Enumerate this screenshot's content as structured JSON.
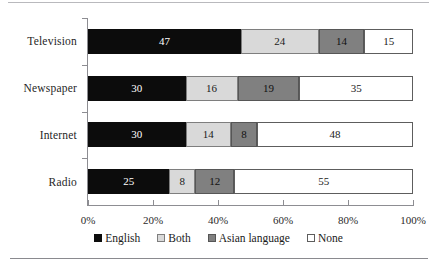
{
  "chart_data": {
    "type": "bar",
    "orientation": "horizontal",
    "stacked": true,
    "stack_mode": "percent",
    "title": "",
    "subtitle": "",
    "xlabel": "",
    "ylabel": "",
    "xlim": [
      0,
      100
    ],
    "xticks": [
      0,
      20,
      40,
      60,
      80,
      100
    ],
    "xtick_labels": [
      "0%",
      "20%",
      "40%",
      "60%",
      "80%",
      "100%"
    ],
    "grid": false,
    "legend_position": "bottom",
    "categories": [
      "Television",
      "Newspaper",
      "Internet",
      "Radio"
    ],
    "series": [
      {
        "name": "English",
        "color": "#0c0c0c",
        "values": [
          47,
          30,
          30,
          25
        ]
      },
      {
        "name": "Both",
        "color": "#d9d9d9",
        "values": [
          24,
          16,
          14,
          8
        ]
      },
      {
        "name": "Asian language",
        "color": "#808080",
        "values": [
          14,
          19,
          8,
          12
        ]
      },
      {
        "name": "None",
        "color": "#ffffff",
        "values": [
          15,
          35,
          48,
          55
        ]
      }
    ],
    "bars": [
      {
        "category": "Television",
        "segments": [
          {
            "series": "English",
            "value": 47,
            "label": "47",
            "start": 0,
            "color": "#0c0c0c"
          },
          {
            "series": "Both",
            "value": 24,
            "label": "24",
            "start": 47,
            "color": "#d9d9d9"
          },
          {
            "series": "Asian language",
            "value": 14,
            "label": "14",
            "start": 71,
            "color": "#808080"
          },
          {
            "series": "None",
            "value": 15,
            "label": "15",
            "start": 85,
            "color": "#ffffff"
          }
        ]
      },
      {
        "category": "Newspaper",
        "segments": [
          {
            "series": "English",
            "value": 30,
            "label": "30",
            "start": 0,
            "color": "#0c0c0c"
          },
          {
            "series": "Both",
            "value": 16,
            "label": "16",
            "start": 30,
            "color": "#d9d9d9"
          },
          {
            "series": "Asian language",
            "value": 19,
            "label": "19",
            "start": 46,
            "color": "#808080"
          },
          {
            "series": "None",
            "value": 35,
            "label": "35",
            "start": 65,
            "color": "#ffffff"
          }
        ]
      },
      {
        "category": "Internet",
        "segments": [
          {
            "series": "English",
            "value": 30,
            "label": "30",
            "start": 0,
            "color": "#0c0c0c"
          },
          {
            "series": "Both",
            "value": 14,
            "label": "14",
            "start": 30,
            "color": "#d9d9d9"
          },
          {
            "series": "Asian language",
            "value": 8,
            "label": "8",
            "start": 44,
            "color": "#808080"
          },
          {
            "series": "None",
            "value": 48,
            "label": "48",
            "start": 52,
            "color": "#ffffff"
          }
        ]
      },
      {
        "category": "Radio",
        "segments": [
          {
            "series": "English",
            "value": 25,
            "label": "25",
            "start": 0,
            "color": "#0c0c0c"
          },
          {
            "series": "Both",
            "value": 8,
            "label": "8",
            "start": 25,
            "color": "#d9d9d9"
          },
          {
            "series": "Asian language",
            "value": 12,
            "label": "12",
            "start": 33,
            "color": "#808080"
          },
          {
            "series": "None",
            "value": 55,
            "label": "55",
            "start": 45,
            "color": "#ffffff"
          }
        ]
      }
    ],
    "legend": [
      {
        "label": "English",
        "color": "#0c0c0c"
      },
      {
        "label": "Both",
        "color": "#d9d9d9"
      },
      {
        "label": "Asian language",
        "color": "#808080"
      },
      {
        "label": "None",
        "color": "#ffffff"
      }
    ]
  }
}
